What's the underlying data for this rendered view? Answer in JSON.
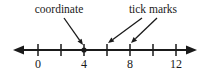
{
  "figure": {
    "background_color": "#ffffff",
    "ink_color": "#1a1a1a"
  },
  "annotations": [
    {
      "id": "coordinate",
      "label": "coordinate",
      "text_x": 59,
      "text_y": 13,
      "anchor": "middle",
      "leaders": [
        {
          "x1": 64,
          "y1": 18,
          "x2": 83,
          "y2": 45
        }
      ]
    },
    {
      "id": "tick-marks",
      "label": "tick marks",
      "text_x": 153,
      "text_y": 13,
      "anchor": "middle",
      "leaders": [
        {
          "x1": 142,
          "y1": 18,
          "x2": 108,
          "y2": 43
        },
        {
          "x1": 157,
          "y1": 18,
          "x2": 131,
          "y2": 43
        }
      ]
    }
  ],
  "chart_data": {
    "type": "number-line",
    "title": "",
    "xlabel": "",
    "ylabel": "",
    "grid": false,
    "legend": "none",
    "axis": {
      "y_pixel": 50,
      "x_start_pixel": 15,
      "x_end_pixel": 195,
      "left_arrow": true,
      "right_arrow": true,
      "pixels_per_unit": 5.75,
      "origin_pixel": 38
    },
    "tick_values": [
      0,
      2,
      4,
      6,
      8,
      10,
      12
    ],
    "tick_pixels": [
      38,
      61,
      84,
      107,
      130,
      153,
      176
    ],
    "tick_labels": [
      "0",
      "",
      "4",
      "",
      "8",
      "",
      "12"
    ],
    "labeled_ticks": [
      {
        "value": 0,
        "label": "0",
        "x": 38
      },
      {
        "value": 4,
        "label": "4",
        "x": 84
      },
      {
        "value": 8,
        "label": "8",
        "x": 130
      },
      {
        "value": 12,
        "label": "12",
        "x": 176
      }
    ],
    "points": [
      {
        "value": 4,
        "x": 84,
        "style": "filled-dot",
        "radius": 2.6
      }
    ],
    "xlim": [
      -4,
      16
    ]
  }
}
